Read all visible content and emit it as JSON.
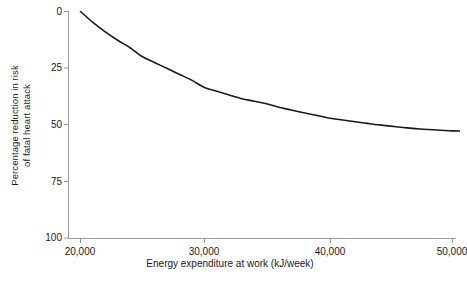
{
  "chart_data": {
    "type": "line",
    "title": "",
    "xlabel": "Energy expenditure at work (kJ/week)",
    "ylabel": "Percentage reduction in risk of fatal heart attack",
    "ylabel_line1": "Percentage reduction in risk",
    "ylabel_line2": "of fatal heart attack",
    "xlim": [
      19000,
      51000
    ],
    "ylim": [
      0,
      100
    ],
    "y_inverted": true,
    "grid": false,
    "legend": null,
    "legend_position": "none",
    "x_ticks": [
      20000,
      30000,
      40000,
      50000
    ],
    "x_tick_labels": [
      "20,000",
      "30,000",
      "40,000",
      "50,000"
    ],
    "y_ticks": [
      0,
      25,
      50,
      75,
      100
    ],
    "y_tick_labels": [
      "0",
      "25",
      "50",
      "75",
      "100"
    ],
    "series": [
      {
        "name": "Percentage reduction in risk of fatal heart attack",
        "color": "#1a1a1a",
        "x": [
          20000,
          21000,
          22000,
          23000,
          24000,
          25000,
          26000,
          27000,
          28000,
          29000,
          30000,
          31000,
          32000,
          33000,
          34000,
          35000,
          36000,
          37000,
          38000,
          39000,
          40000,
          41000,
          42000,
          43000,
          44000,
          45000,
          46000,
          47000,
          48000,
          49000,
          50000,
          51000
        ],
        "y": [
          0,
          4.8,
          9.0,
          12.7,
          16.0,
          20.0,
          22.6,
          25.2,
          27.8,
          30.4,
          33.6,
          35.2,
          36.9,
          38.5,
          39.6,
          40.7,
          42.3,
          43.5,
          44.7,
          45.8,
          47.0,
          47.8,
          48.6,
          49.3,
          50.0,
          50.6,
          51.2,
          51.7,
          52.1,
          52.4,
          52.7,
          52.8
        ]
      }
    ]
  },
  "axis": {
    "spine_color": "#9a9a9a",
    "tick_color": "#9a9a9a"
  },
  "caption": {
    "text": ""
  }
}
